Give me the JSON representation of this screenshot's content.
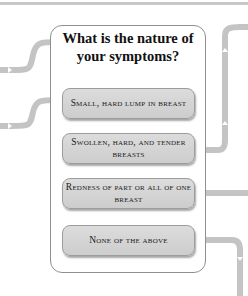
{
  "diagram": {
    "question": "What is the nature of your symptoms?",
    "options": [
      {
        "label": "Small, hard lump in breast"
      },
      {
        "label": "Swollen, hard, and tender breasts"
      },
      {
        "label": "Redness of part or all of one breast"
      },
      {
        "label": "None of the above"
      }
    ],
    "colors": {
      "connector": "#c4c4c4",
      "panel_border": "#8f8f8f",
      "option_fill": "#d6d6d6"
    }
  }
}
